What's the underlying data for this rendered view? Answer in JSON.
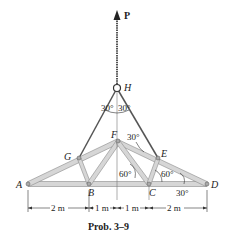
{
  "figure": {
    "caption": "Prob. 3–9",
    "force_label": "P",
    "joints": {
      "A": "A",
      "B": "B",
      "C": "C",
      "D": "D",
      "E": "E",
      "F": "F",
      "G": "G",
      "H": "H"
    },
    "angles": {
      "H_left": "30°",
      "H_right": "30°",
      "F_cable": "30°",
      "B_angle": "60°",
      "C_angle": "60°",
      "D_angle": "30°"
    },
    "dimensions": [
      "2 m",
      "1 m",
      "1 m",
      "2 m"
    ],
    "colors": {
      "member_fill": "#d6d6d6",
      "member_edge": "#8a8a8a",
      "line": "#333333"
    }
  }
}
